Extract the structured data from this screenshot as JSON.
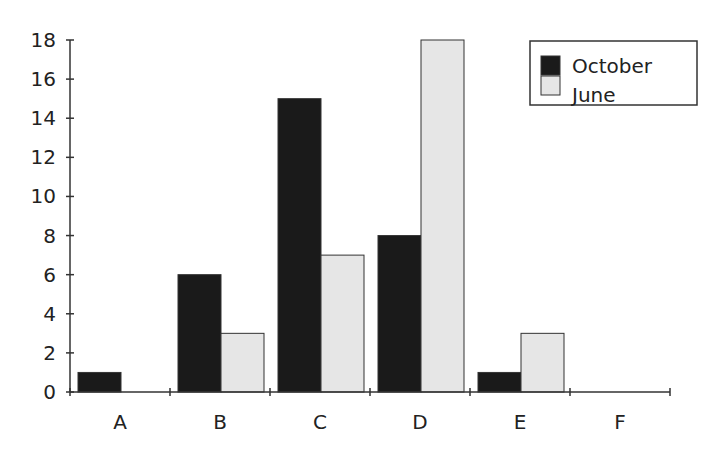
{
  "chart_data": {
    "type": "bar",
    "title": "",
    "xlabel": "",
    "ylabel": "",
    "categories": [
      "A",
      "B",
      "C",
      "D",
      "E",
      "F"
    ],
    "series": [
      {
        "name": "October",
        "color": "#1a1a1a",
        "values": [
          1,
          6,
          15,
          8,
          1,
          0
        ]
      },
      {
        "name": "June",
        "color": "#e6e6e6",
        "values": [
          0,
          3,
          7,
          18,
          3,
          0
        ]
      }
    ],
    "ylim": [
      0,
      18
    ],
    "yticks": [
      0,
      2,
      4,
      6,
      8,
      10,
      12,
      14,
      16,
      18
    ],
    "grid": false,
    "legend_position": "top-right"
  },
  "legend": {
    "items": [
      {
        "label": "October"
      },
      {
        "label": "June"
      }
    ]
  }
}
